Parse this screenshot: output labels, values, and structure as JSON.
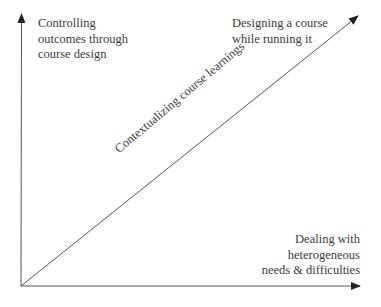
{
  "diagram": {
    "type": "conceptual-axes",
    "colors": {
      "axis": "#444444",
      "text": "#3a3a3a",
      "background": "#ffffff"
    },
    "labels": {
      "top_left": [
        "Controlling",
        "outcomes through",
        "course design"
      ],
      "top_right": [
        "Designing a course",
        "while running it"
      ],
      "bottom_right": [
        "Dealing with",
        "heterogeneous",
        "needs & difficulties"
      ],
      "diagonal": "Contextualizing course learnings"
    },
    "axes": [
      {
        "name": "vertical-axis",
        "from": [
          21,
          286
        ],
        "to": [
          22,
          14
        ]
      },
      {
        "name": "horizontal-axis",
        "from": [
          21,
          286
        ],
        "to": [
          360,
          286
        ]
      },
      {
        "name": "diagonal-axis",
        "from": [
          21,
          286
        ],
        "to": [
          358,
          16
        ]
      }
    ]
  }
}
